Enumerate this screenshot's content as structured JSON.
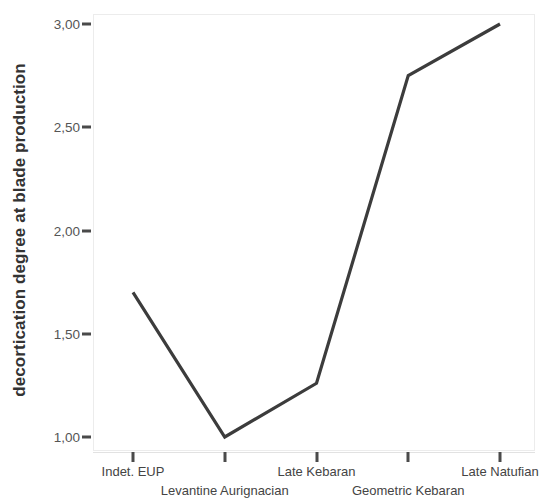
{
  "chart_data": {
    "type": "line",
    "title": "",
    "subtitle": "",
    "xlabel": "",
    "ylabel": "decortication degree at blade production",
    "categories": [
      "Indet. EUP",
      "Levantine Aurignacian",
      "Late Kebaran",
      "Geometric Kebaran",
      "Late Natufian"
    ],
    "values": [
      1.7,
      1.0,
      1.26,
      2.75,
      3.0
    ],
    "series": [
      {
        "name": "decortication degree at blade production",
        "values": [
          1.7,
          1.0,
          1.26,
          2.75,
          3.0
        ]
      }
    ],
    "ylim": [
      1.0,
      3.0
    ],
    "ytick_labels": [
      "1,00",
      "1,50",
      "2,00",
      "2,50",
      "3,00"
    ],
    "ytick_values": [
      1.0,
      1.5,
      2.0,
      2.5,
      3.0
    ],
    "grid": false,
    "legend": false,
    "legend_position": "none",
    "line_color": "#3c3c3c",
    "label_rows": [
      0,
      1,
      0,
      1,
      0
    ]
  },
  "axis": {
    "y_title": "decortication degree at blade production",
    "ticks_y": [
      {
        "label": "3,00",
        "value": 3.0
      },
      {
        "label": "2,50",
        "value": 2.5
      },
      {
        "label": "2,00",
        "value": 2.0
      },
      {
        "label": "1,50",
        "value": 1.5
      },
      {
        "label": "1,00",
        "value": 1.0
      }
    ],
    "ticks_x": [
      {
        "label": "Indet. EUP",
        "row": 0
      },
      {
        "label": "Levantine Aurignacian",
        "row": 1
      },
      {
        "label": "Late Kebaran",
        "row": 0
      },
      {
        "label": "Geometric Kebaran",
        "row": 1
      },
      {
        "label": "Late Natufian",
        "row": 0
      }
    ]
  },
  "colors": {
    "line": "#3c3c3c",
    "tick_label": "#555555",
    "axis_title": "#333333",
    "frame": "#ececec",
    "background": "#ffffff"
  }
}
